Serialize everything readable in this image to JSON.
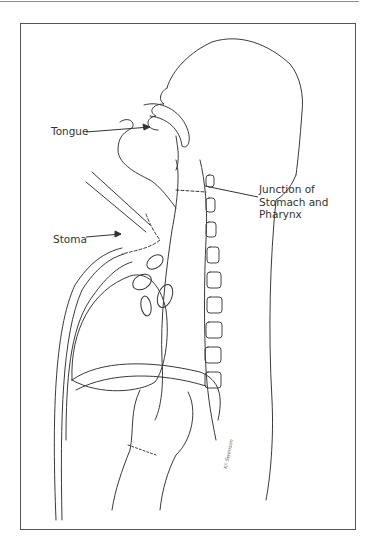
{
  "figure": {
    "type": "anatomical illustration",
    "labels": {
      "tongue": "Tongue",
      "junction": "Junction of Stomach and Pharynx",
      "stoma": "Stoma"
    },
    "signature": "Kil Swenson",
    "colors": {
      "line": "#333333",
      "frame": "#555555",
      "background": "#ffffff"
    }
  }
}
